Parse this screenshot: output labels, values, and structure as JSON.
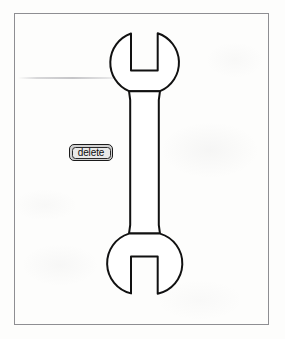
{
  "canvas": {
    "width": 285,
    "height": 339,
    "background_color": "#fdfdfc",
    "type": "scanned-line-drawing"
  },
  "frame": {
    "name": "drawing-border",
    "stroke_color": "#8e8e92",
    "x": 14,
    "y": 13,
    "width": 255,
    "height": 312
  },
  "artifacts": {
    "smudge_line_label": "",
    "description": "faint horizontal scanner streak"
  },
  "button": {
    "label": "delete",
    "fill_color": "#e9e9e9",
    "border_color": "#1b1b1b",
    "x": 69,
    "y": 144,
    "width": 44,
    "height": 17
  },
  "diagram": {
    "title": "",
    "shape_name": "double-open-end-wrench",
    "stroke_color": "#111111",
    "fill_color": "#ffffff",
    "stroke_width": 2,
    "orientation": "vertical",
    "parts": [
      {
        "name": "top-head",
        "type": "circle-with-notch",
        "center_x": 144.5,
        "center_y": 62,
        "radius": 31,
        "notch_opens": "up",
        "notch_left_x": 131,
        "notch_right_x": 157,
        "notch_depth_y": 70
      },
      {
        "name": "shaft",
        "type": "rectangle",
        "left_x": 130,
        "right_x": 158,
        "top_y": 90,
        "bottom_y": 234
      },
      {
        "name": "bottom-head",
        "type": "circle-with-notch",
        "center_x": 144.5,
        "center_y": 264,
        "radius": 31,
        "notch_opens": "down",
        "notch_left_x": 131,
        "notch_right_x": 157,
        "notch_depth_y": 256
      }
    ]
  }
}
